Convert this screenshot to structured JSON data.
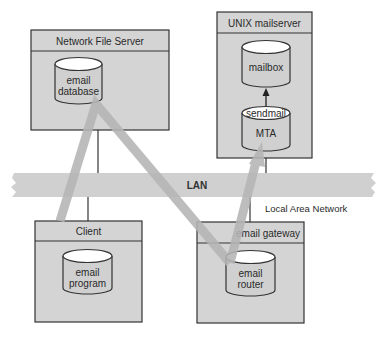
{
  "diagram": {
    "colors": {
      "box_fill": "#d4d4d4",
      "header_fill": "#cfcfcf",
      "stroke": "#333333",
      "flow": "#b5b5b5",
      "lan": "#cdcdcd"
    },
    "nodes": {
      "nfs": {
        "title": "Network File Server",
        "store_line1": "email",
        "store_line2": "database"
      },
      "unix": {
        "title": "UNIX mailserver",
        "mailbox": "mailbox",
        "mta_top": "sendmail",
        "mta": "MTA"
      },
      "client": {
        "title": "Client",
        "store_line1": "email",
        "store_line2": "program"
      },
      "gateway": {
        "title": "email gateway",
        "store_line1": "email",
        "store_line2": "router"
      }
    },
    "lan": {
      "label": "LAN",
      "caption": "Local Area Network"
    }
  }
}
